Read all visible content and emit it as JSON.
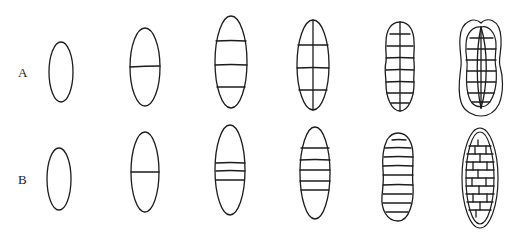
{
  "rows": [
    {
      "label": "A",
      "description": "Muriform series: transverse then longitudinal septa"
    },
    {
      "label": "B",
      "description": "Transverse septation series, ending in brick-wall (dictyospore) pattern"
    }
  ],
  "columns": 6,
  "colors": {
    "stroke": "#1c1c1c",
    "background": "#ffffff"
  }
}
